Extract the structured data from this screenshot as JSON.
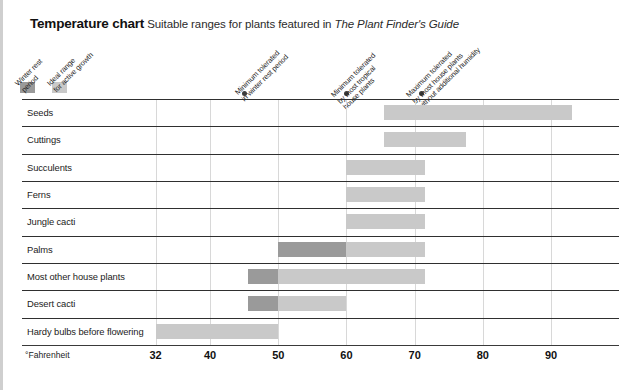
{
  "title": {
    "main": "Temperature chart",
    "subtitle": "Suitable ranges for plants featured in ",
    "italic_part": "The Plant Finder's Guide"
  },
  "legend": {
    "items": [
      {
        "label": "Winter rest\nperiod",
        "label_line1": "Winter rest",
        "label_line2": "period",
        "color": "#9a9a9a"
      },
      {
        "label": "Ideal range\nfor active growth",
        "label_line1": "Ideal range",
        "label_line2": "for active growth",
        "color": "#c9c9c9"
      }
    ]
  },
  "callouts": [
    {
      "line1": "Minimum tolerated",
      "line2": "in winter rest period",
      "value": 45
    },
    {
      "line1": "Minimum tolerated",
      "line2": "by most tropical",
      "line3": "house plants",
      "value": 60
    },
    {
      "line1": "Maximum tolerated",
      "line2": "by most house plants",
      "line3": "without additional humidity",
      "value": 71
    }
  ],
  "axis": {
    "unit_label": "°Fahrenheit",
    "ticks": [
      32,
      40,
      50,
      60,
      70,
      80,
      90
    ],
    "tick_labels": [
      "32",
      "40",
      "50",
      "60",
      "70",
      "80",
      "90"
    ],
    "min": 30.5,
    "max": 94.5
  },
  "chart_data": {
    "type": "bar",
    "title": "Temperature chart",
    "subtitle": "Suitable ranges for plants featured in The Plant Finder's Guide",
    "xlabel": "°Fahrenheit",
    "ylabel": "",
    "xlim": [
      30.5,
      94.5
    ],
    "grid": true,
    "orientation": "horizontal",
    "legend_position": "top-left",
    "xticks": [
      32,
      40,
      50,
      60,
      70,
      80,
      90
    ],
    "series": [
      {
        "name": "Winter rest period",
        "color": "#9a9a9a"
      },
      {
        "name": "Ideal range for active growth",
        "color": "#c9c9c9"
      }
    ],
    "categories": [
      "Seeds",
      "Cuttings",
      "Succulents",
      "Ferns",
      "Jungle cacti",
      "Palms",
      "Most other house plants",
      "Desert cacti",
      "Hardy bulbs before flowering"
    ],
    "rows": [
      {
        "category": "Seeds",
        "bars": [
          {
            "series": "Ideal range for active growth",
            "start": 65.5,
            "end": 93,
            "color": "#c9c9c9"
          }
        ]
      },
      {
        "category": "Cuttings",
        "bars": [
          {
            "series": "Ideal range for active growth",
            "start": 65.5,
            "end": 77.5,
            "color": "#c9c9c9"
          }
        ]
      },
      {
        "category": "Succulents",
        "bars": [
          {
            "series": "Ideal range for active growth",
            "start": 60,
            "end": 71.5,
            "color": "#c9c9c9"
          }
        ]
      },
      {
        "category": "Ferns",
        "bars": [
          {
            "series": "Ideal range for active growth",
            "start": 60,
            "end": 71.5,
            "color": "#c9c9c9"
          }
        ]
      },
      {
        "category": "Jungle cacti",
        "bars": [
          {
            "series": "Ideal range for active growth",
            "start": 60,
            "end": 71.5,
            "color": "#c9c9c9"
          }
        ]
      },
      {
        "category": "Palms",
        "bars": [
          {
            "series": "Winter rest period",
            "start": 50,
            "end": 60,
            "color": "#9a9a9a"
          },
          {
            "series": "Ideal range for active growth",
            "start": 60,
            "end": 71.5,
            "color": "#c9c9c9"
          }
        ]
      },
      {
        "category": "Most other house plants",
        "bars": [
          {
            "series": "Winter rest period",
            "start": 45.5,
            "end": 50,
            "color": "#9a9a9a"
          },
          {
            "series": "Ideal range for active growth",
            "start": 50,
            "end": 71.5,
            "color": "#c9c9c9"
          }
        ]
      },
      {
        "category": "Desert cacti",
        "bars": [
          {
            "series": "Winter rest period",
            "start": 45.5,
            "end": 50,
            "color": "#9a9a9a"
          },
          {
            "series": "Ideal range for active growth",
            "start": 50,
            "end": 60,
            "color": "#c9c9c9"
          }
        ]
      },
      {
        "category": "Hardy bulbs before flowering",
        "bars": [
          {
            "series": "Ideal range for active growth",
            "start": 32,
            "end": 50,
            "color": "#c9c9c9"
          }
        ]
      }
    ],
    "annotations": [
      {
        "text": "Minimum tolerated in winter rest period",
        "value": 45
      },
      {
        "text": "Minimum tolerated by most tropical house plants",
        "value": 60
      },
      {
        "text": "Maximum tolerated by most house plants without additional humidity",
        "value": 71
      }
    ]
  }
}
